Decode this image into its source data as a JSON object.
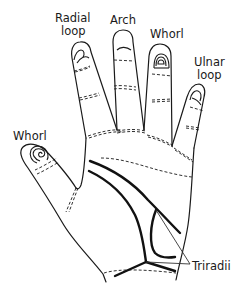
{
  "diagram": {
    "labels": {
      "index": [
        "Radial",
        "loop"
      ],
      "middle": [
        "Arch"
      ],
      "ring": [
        "Whorl"
      ],
      "little": [
        "Ulnar",
        "loop"
      ],
      "thumb": [
        "Whorl"
      ],
      "triradii": [
        "Triradii"
      ]
    },
    "colors": {
      "line": "#1a1a1a",
      "background": "#ffffff"
    }
  }
}
